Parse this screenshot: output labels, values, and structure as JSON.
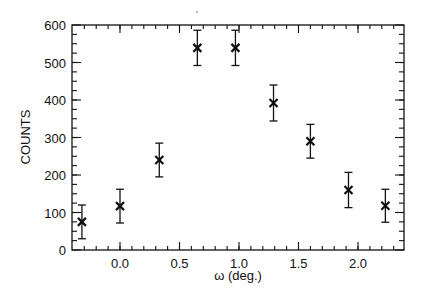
{
  "chart_data": {
    "type": "scatter",
    "title": "",
    "xlabel": "ω (deg.)",
    "ylabel": "COUNTS",
    "xlim": [
      -0.4,
      2.4
    ],
    "ylim": [
      0,
      600
    ],
    "x_ticks": [
      0.0,
      0.5,
      1.0,
      1.5,
      2.0
    ],
    "x_tick_labels": [
      "0.0",
      "0.5",
      "1.0",
      "1.5",
      "2.0"
    ],
    "x_minor_step": 0.1,
    "y_ticks": [
      0,
      100,
      200,
      300,
      400,
      500,
      600
    ],
    "y_tick_labels": [
      "0",
      "100",
      "200",
      "300",
      "400",
      "500",
      "600"
    ],
    "y_minor_step": 25,
    "grid": false,
    "legend": null,
    "marker": "x",
    "series": [
      {
        "name": "counts",
        "x": [
          -0.32,
          0.0,
          0.33,
          0.65,
          0.97,
          1.29,
          1.6,
          1.92,
          2.23
        ],
        "y": [
          75,
          117,
          240,
          539,
          539,
          392,
          290,
          160,
          118
        ],
        "yerr": [
          45,
          45,
          45,
          47,
          47,
          48,
          45,
          47,
          44
        ]
      }
    ]
  }
}
